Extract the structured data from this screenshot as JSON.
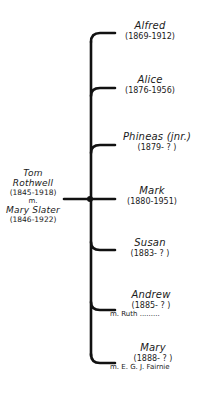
{
  "parents": {
    "father": {
      "name": "Tom Rothwell",
      "dates": "(1845-1918)"
    },
    "marriage": "m.",
    "mother": {
      "name": "Mary Slater",
      "dates": "(1846-1922)"
    }
  },
  "children": [
    {
      "name": "Alfred",
      "dates": "(1869-1912)",
      "spouse": ""
    },
    {
      "name": "Alice",
      "dates": "(1876-1956)",
      "spouse": ""
    },
    {
      "name": "Phineas (jnr.)",
      "dates": "(1879- ? )",
      "spouse": ""
    },
    {
      "name": "Mark",
      "dates": "(1880-1951)",
      "spouse": ""
    },
    {
      "name": "Susan",
      "dates": "(1883- ? )",
      "spouse": ""
    },
    {
      "name": "Andrew",
      "dates": "(1885- ? )",
      "spouse": "m. Ruth ........."
    },
    {
      "name": "Mary",
      "dates": "(1888- ? )",
      "spouse": "m. E. G. J. Fairnie"
    }
  ],
  "colors": {
    "line": "#111111",
    "background": "#ffffff"
  }
}
